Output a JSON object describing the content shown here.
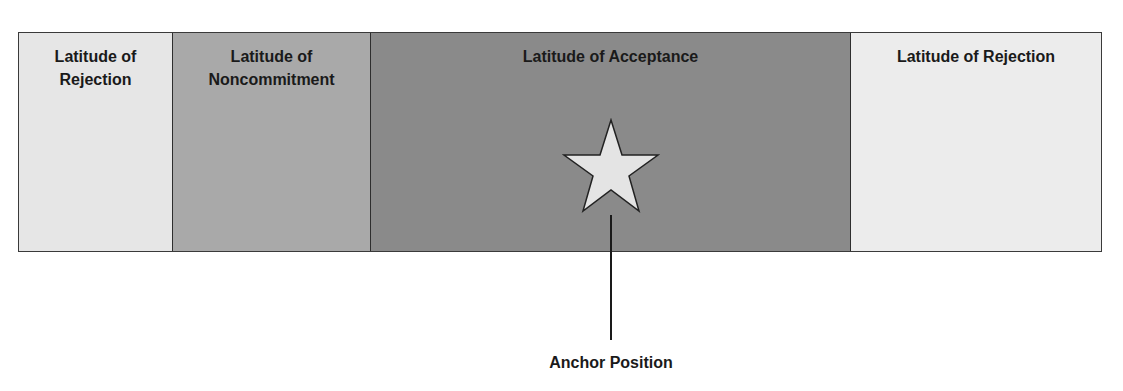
{
  "diagram": {
    "zones": [
      {
        "label_line1": "Latitude of",
        "label_line2": "Rejection",
        "shade": "#e6e6e6"
      },
      {
        "label_line1": "Latitude of",
        "label_line2": "Noncommitment",
        "shade": "#a9a9a9"
      },
      {
        "label_line1": "Latitude of Acceptance",
        "label_line2": "",
        "shade": "#8a8a8a"
      },
      {
        "label_line1": "Latitude of Rejection",
        "label_line2": "",
        "shade": "#ececec"
      }
    ],
    "marker": {
      "icon": "star-icon",
      "color": "#e4e4e4"
    },
    "anchor_label": "Anchor Position"
  }
}
